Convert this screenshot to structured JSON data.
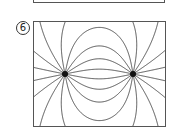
{
  "previous_figure": {
    "partial": true
  },
  "figure": {
    "label": "6",
    "box": {
      "x": 33,
      "y": 21,
      "width": 133,
      "height": 106
    },
    "charges": [
      {
        "x": 65,
        "y": 74,
        "sign": "+"
      },
      {
        "x": 133,
        "y": 74,
        "sign": "-"
      }
    ],
    "lines_per_charge": 16,
    "colors": {
      "line": "#444444",
      "charge": "#111111",
      "border": "#555555"
    }
  }
}
